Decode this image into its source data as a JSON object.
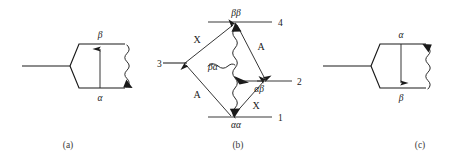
{
  "figure": {
    "background_color": "#ffffff",
    "ink_color": "#1a1a1a",
    "panels": [
      {
        "id": "a",
        "caption": "(a)",
        "type": "hexagon-transition",
        "top_label": "β",
        "bottom_label": "α",
        "arrow_direction": "up",
        "wavy_arrow_end": "bottom"
      },
      {
        "id": "b",
        "caption": "(b)",
        "type": "four-level-energy-diagram",
        "levels": [
          {
            "number": "1",
            "state": "αα",
            "position": "bottom"
          },
          {
            "number": "2",
            "state": "αβ",
            "position": "right"
          },
          {
            "number": "3",
            "state": "",
            "position": "left"
          },
          {
            "number": "4",
            "state": "ββ",
            "position": "top"
          }
        ],
        "transition_labels": [
          {
            "text": "X",
            "position": "upper-left"
          },
          {
            "text": "A",
            "position": "upper-right"
          },
          {
            "text": "A",
            "position": "lower-left"
          },
          {
            "text": "X",
            "position": "lower-right"
          }
        ],
        "center_label": "βα"
      },
      {
        "id": "c",
        "caption": "(c)",
        "type": "hexagon-transition",
        "top_label": "α",
        "bottom_label": "β",
        "arrow_direction": "down",
        "wavy_arrow_end": "top"
      }
    ]
  }
}
